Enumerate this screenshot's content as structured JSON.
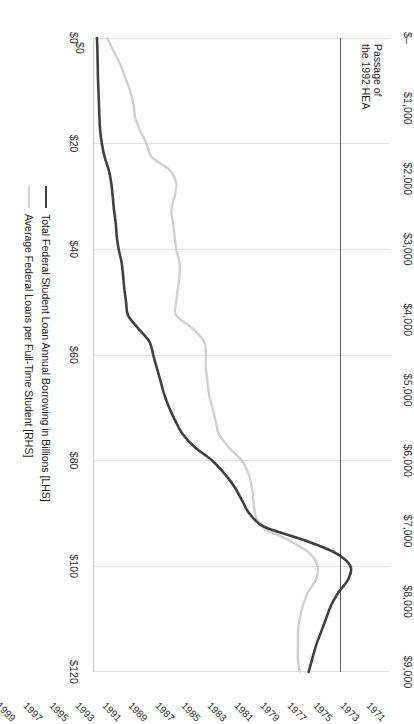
{
  "chart_data": {
    "type": "line",
    "title": "",
    "xlabel": "",
    "ylabel": "",
    "orientation": "rotated-90",
    "grid": true,
    "legend_position": "right",
    "x": [
      1971,
      1972,
      1973,
      1974,
      1975,
      1976,
      1977,
      1978,
      1979,
      1980,
      1981,
      1982,
      1983,
      1984,
      1985,
      1986,
      1987,
      1988,
      1989,
      1990,
      1991,
      1992,
      1993,
      1994,
      1995,
      1996,
      1997,
      1998,
      1999,
      2000,
      2001,
      2002,
      2003,
      2004,
      2005,
      2006,
      2007,
      2008,
      2009,
      2010,
      2011,
      2012,
      2013,
      2014,
      2015,
      2016,
      2017,
      2018,
      2019
    ],
    "xticklabels": [
      "1971",
      "1973",
      "1975",
      "1977",
      "1979",
      "1981",
      "1983",
      "1985",
      "1987",
      "1989",
      "1991",
      "1993",
      "1995",
      "1997",
      "1999",
      "2001",
      "2003",
      "2005",
      "2007",
      "2009",
      "2011",
      "2013",
      "2015",
      "2017",
      "2019"
    ],
    "left_axis": {
      "name": "Total Federal Student Loan Annual Borrowing in Billions [LHS]",
      "ticklabels": [
        "$0",
        "$20",
        "$40",
        "$60",
        "$80",
        "$100",
        "$120"
      ],
      "tickvalues": [
        0,
        20,
        40,
        60,
        80,
        100,
        120
      ],
      "ylim": [
        0,
        120
      ],
      "color": "#404040"
    },
    "right_axis": {
      "name": "Average Federal Loans per Full-Time Student [RHS]",
      "ticklabels": [
        "$–",
        "$1,000",
        "$2,000",
        "$3,000",
        "$4,000",
        "$5,000",
        "$6,000",
        "$7,000",
        "$8,000",
        "$9,000"
      ],
      "tickvalues": [
        0,
        1000,
        2000,
        3000,
        4000,
        5000,
        6000,
        7000,
        8000,
        9000
      ],
      "ylim": [
        0,
        9000
      ],
      "color": "#d0d0d0"
    },
    "series": [
      {
        "name": "Total Federal Student Loan Annual Borrowing in Billions [LHS]",
        "axis": "left",
        "color": "#404040",
        "values": [
          1.2,
          1.4,
          1.5,
          1.6,
          1.8,
          2.0,
          2.2,
          2.5,
          3.2,
          4.3,
          6.0,
          7.0,
          7.6,
          8.1,
          8.8,
          9.2,
          10.0,
          11.2,
          11.8,
          12.3,
          13.0,
          13.8,
          18.0,
          22.5,
          24.0,
          25.5,
          27.0,
          28.5,
          30.5,
          33.0,
          36.0,
          41.0,
          48.0,
          53.0,
          57.0,
          60.0,
          63.0,
          69.0,
          85.0,
          98.0,
          104.0,
          103.0,
          99.0,
          96.0,
          94.0,
          92.0,
          90.0,
          88.5,
          87.0
        ]
      },
      {
        "name": "Average Federal Loans per Full-Time Student [RHS]",
        "axis": "right",
        "color": "#d0d0d0",
        "values": [
          400,
          600,
          800,
          950,
          1100,
          1200,
          1250,
          1400,
          1600,
          1750,
          2300,
          2500,
          2450,
          2350,
          2400,
          2450,
          2500,
          2600,
          2600,
          2550,
          2500,
          2500,
          3000,
          3350,
          3400,
          3400,
          3450,
          3500,
          3600,
          3700,
          3800,
          4100,
          4500,
          4700,
          4800,
          4850,
          4900,
          5100,
          5900,
          6550,
          6800,
          6750,
          6500,
          6350,
          6250,
          6200,
          6200,
          6200,
          6250
        ]
      }
    ],
    "annotation": {
      "text": "Passage of\nthe 1992 HEA",
      "year": 1992
    }
  }
}
